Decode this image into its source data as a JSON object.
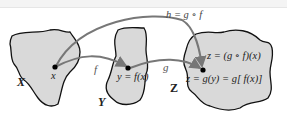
{
  "diagram": {
    "type": "function-composition",
    "sets": [
      {
        "id": "X",
        "label": "X"
      },
      {
        "id": "Y",
        "label": "Y"
      },
      {
        "id": "Z",
        "label": "Z"
      }
    ],
    "points": {
      "x": "x",
      "y": "y = f(x)",
      "z_line1": "z = (g ∘ f)(x)",
      "z_line2": "z = g(y) = g[ f(x)]"
    },
    "arrows": {
      "f": "f",
      "g": "g",
      "h": "h = g ∘ f"
    },
    "colors": {
      "region_fill": "#d9d9d9",
      "region_stroke": "#111111",
      "arrow": "#777777",
      "point": "#000000"
    }
  }
}
